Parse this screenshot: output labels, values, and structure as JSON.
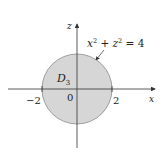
{
  "diagram": {
    "axes": {
      "horizontal_label": "x",
      "vertical_label": "z"
    },
    "ticks": {
      "neg": "−2",
      "origin": "0",
      "pos": "2"
    },
    "region_label": {
      "main": "D",
      "sub": "3"
    },
    "equation": {
      "x": "x",
      "exp1": "2",
      "plus": " + ",
      "z": "z",
      "exp2": "2",
      "rhs": " = 4"
    },
    "colors": {
      "disk_fill": "#d6d6d6",
      "disk_stroke": "#8a8a8a",
      "axis": "#333333"
    }
  }
}
